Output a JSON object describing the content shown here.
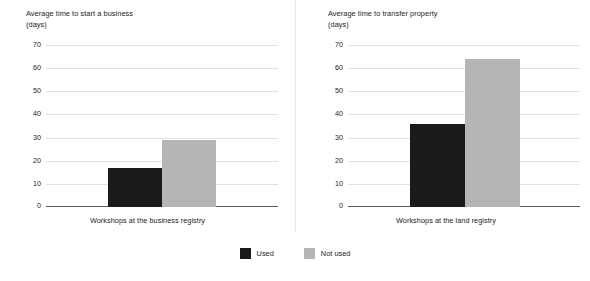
{
  "chart_data": [
    {
      "type": "bar",
      "title": "Average time to start a business",
      "subtitle": "(days)",
      "ylabel": "days",
      "xlabel": "Workshops at the business registry",
      "ylim": [
        0,
        70
      ],
      "yticks": [
        0,
        10,
        20,
        30,
        40,
        50,
        60,
        70
      ],
      "grid": true,
      "categories": [
        "Workshops at the business registry"
      ],
      "series": [
        {
          "name": "Used",
          "values": [
            17
          ],
          "color": "#1a1a1a"
        },
        {
          "name": "Not used",
          "values": [
            29
          ],
          "color": "#b5b5b5"
        }
      ]
    },
    {
      "type": "bar",
      "title": "Average time to transfer property",
      "subtitle": "(days)",
      "ylabel": "days",
      "xlabel": "Workshops at the land registry",
      "ylim": [
        0,
        70
      ],
      "yticks": [
        0,
        10,
        20,
        30,
        40,
        50,
        60,
        70
      ],
      "grid": true,
      "categories": [
        "Workshops at the land registry"
      ],
      "series": [
        {
          "name": "Used",
          "values": [
            36
          ],
          "color": "#1a1a1a"
        },
        {
          "name": "Not used",
          "values": [
            64.5
          ],
          "color": "#b5b5b5"
        }
      ]
    }
  ],
  "legend": {
    "position": "bottom-center",
    "items": [
      {
        "label": "Used",
        "color": "#1a1a1a"
      },
      {
        "label": "Not used",
        "color": "#b5b5b5"
      }
    ]
  },
  "ytick_labels": [
    "70",
    "60",
    "50",
    "40",
    "30",
    "20",
    "10",
    "0"
  ]
}
